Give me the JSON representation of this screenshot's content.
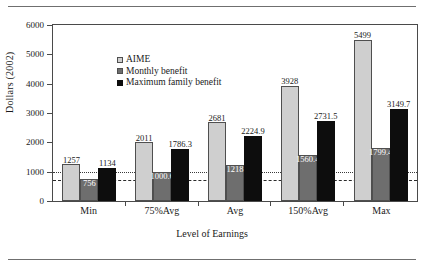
{
  "chart_data": {
    "type": "bar",
    "title": "",
    "xlabel": "Level of Earnings",
    "ylabel": "Dollars (2002)",
    "categories": [
      "Min",
      "75%Avg",
      "Avg",
      "150%Avg",
      "Max"
    ],
    "series": [
      {
        "name": "AIME",
        "color": "#cfcfcf",
        "values": [
          1257,
          2011,
          2681,
          3928,
          5499
        ],
        "labels": [
          "1257",
          "2011",
          "2681",
          "3928",
          "5499"
        ]
      },
      {
        "name": "Monthly benefit",
        "color": "#6e6e6e",
        "values": [
          756,
          1000.6,
          1218,
          1560.4,
          1799.4
        ],
        "labels": [
          "756",
          "1000.6",
          "1218",
          "1560.4",
          "1799.4"
        ]
      },
      {
        "name": "Maximum family benefit",
        "color": "#0d0d0d",
        "values": [
          1134,
          1786.3,
          2224.9,
          2731.5,
          3149.7
        ],
        "labels": [
          "1134",
          "1786.3",
          "2224.9",
          "2731.5",
          "3149.7"
        ]
      }
    ],
    "ylim": [
      0,
      6000
    ],
    "yticks": [
      0,
      1000,
      2000,
      3000,
      4000,
      5000,
      6000
    ],
    "ytick_labels": [
      "0",
      "1000",
      "2000",
      "3000",
      "4000",
      "5000",
      "6000"
    ],
    "grid": false,
    "legend_position": "top-left",
    "reference_lines": [
      {
        "name": "dotted-reference-line",
        "value": 1000,
        "style": "dotted"
      },
      {
        "name": "dashed-reference-line",
        "value": 700,
        "style": "dashed"
      }
    ]
  }
}
